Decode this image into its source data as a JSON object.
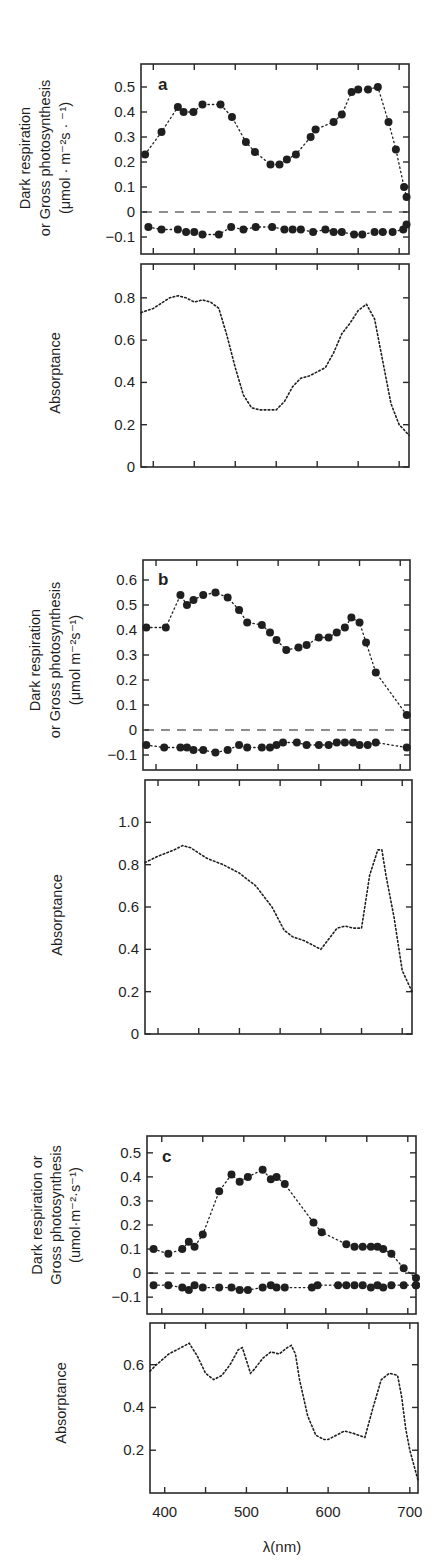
{
  "figure": {
    "xlabel": "λ(nm)",
    "x_tick_labels": [
      "400",
      "500",
      "600",
      "700"
    ]
  },
  "chart_data": [
    {
      "panel": "a",
      "type": "scatter",
      "title": "a",
      "ylabel_lines": [
        "Dark respiration",
        "or Gross photosynthesis",
        "(μmol · m⁻²s · ⁻¹)"
      ],
      "xlabel": "λ(nm)",
      "xlim": [
        385,
        712
      ],
      "ylim": [
        -0.168,
        0.592
      ],
      "yticks": [
        -0.1,
        0,
        0.1,
        0.2,
        0.3,
        0.4,
        0.5
      ],
      "ytick_labels": [
        "−0.1",
        "0",
        "0.1",
        "0.2",
        "0.3",
        "0.4",
        "0.5"
      ],
      "zero_line": "dashed",
      "series": [
        {
          "name": "Gross photosynthesis",
          "x": [
            390,
            410,
            430,
            437,
            449,
            460,
            482,
            496,
            513,
            524,
            543,
            554,
            563,
            574,
            592,
            598,
            620,
            630,
            642,
            650,
            662,
            674,
            687,
            696,
            706,
            709
          ],
          "y": [
            0.23,
            0.32,
            0.42,
            0.4,
            0.4,
            0.43,
            0.43,
            0.38,
            0.28,
            0.24,
            0.19,
            0.19,
            0.21,
            0.23,
            0.3,
            0.33,
            0.36,
            0.39,
            0.48,
            0.49,
            0.49,
            0.5,
            0.36,
            0.25,
            0.1,
            0.06
          ]
        },
        {
          "name": "Dark respiration",
          "x": [
            394,
            410,
            430,
            440,
            450,
            460,
            480,
            495,
            510,
            525,
            545,
            560,
            570,
            580,
            595,
            610,
            620,
            630,
            645,
            655,
            670,
            680,
            692,
            705,
            709
          ],
          "y": [
            -0.06,
            -0.07,
            -0.07,
            -0.08,
            -0.08,
            -0.09,
            -0.09,
            -0.06,
            -0.07,
            -0.06,
            -0.06,
            -0.07,
            -0.07,
            -0.07,
            -0.08,
            -0.07,
            -0.08,
            -0.08,
            -0.09,
            -0.09,
            -0.08,
            -0.08,
            -0.08,
            -0.07,
            -0.05
          ]
        }
      ]
    },
    {
      "panel": "a",
      "type": "line",
      "ylabel": "Absorptance",
      "xlim": [
        385,
        712
      ],
      "ylim": [
        0,
        0.96
      ],
      "yticks": [
        0,
        0.2,
        0.4,
        0.6,
        0.8
      ],
      "ytick_labels": [
        "0",
        "0.2",
        "0.4",
        "0.6",
        "0.8"
      ],
      "series": [
        {
          "name": "Absorptance",
          "x": [
            385,
            400,
            420,
            430,
            440,
            450,
            460,
            470,
            480,
            490,
            500,
            510,
            520,
            530,
            540,
            550,
            560,
            570,
            580,
            590,
            600,
            610,
            620,
            630,
            640,
            650,
            660,
            670,
            680,
            690,
            700,
            705,
            712
          ],
          "y": [
            0.73,
            0.75,
            0.8,
            0.81,
            0.8,
            0.78,
            0.79,
            0.78,
            0.75,
            0.62,
            0.47,
            0.34,
            0.28,
            0.27,
            0.27,
            0.27,
            0.31,
            0.38,
            0.42,
            0.43,
            0.45,
            0.47,
            0.54,
            0.63,
            0.68,
            0.74,
            0.77,
            0.7,
            0.5,
            0.3,
            0.2,
            0.18,
            0.15
          ]
        }
      ]
    },
    {
      "panel": "b",
      "type": "scatter",
      "title": "b",
      "ylabel_lines": [
        "Dark respiration",
        "or Gross photosynthesis",
        "(μmol m⁻²s⁻¹)"
      ],
      "xlabel": "λ(nm)",
      "xlim": [
        384,
        712
      ],
      "ylim": [
        -0.16,
        0.68
      ],
      "yticks": [
        -0.1,
        0,
        0.1,
        0.2,
        0.3,
        0.4,
        0.5,
        0.6
      ],
      "ytick_labels": [
        "−0.1",
        "0",
        "0.1",
        "0.2",
        "0.3",
        "0.4",
        "0.5",
        "0.6"
      ],
      "zero_line": "dashed",
      "series": [
        {
          "name": "Gross photosynthesis",
          "x": [
            388,
            412,
            430,
            438,
            446,
            458,
            473,
            488,
            502,
            512,
            530,
            540,
            548,
            560,
            575,
            585,
            600,
            612,
            622,
            632,
            640,
            650,
            658,
            670,
            708
          ],
          "y": [
            0.41,
            0.41,
            0.54,
            0.5,
            0.52,
            0.54,
            0.55,
            0.53,
            0.48,
            0.43,
            0.42,
            0.39,
            0.36,
            0.32,
            0.33,
            0.34,
            0.37,
            0.37,
            0.39,
            0.41,
            0.45,
            0.43,
            0.35,
            0.23,
            0.06
          ]
        },
        {
          "name": "Dark respiration",
          "x": [
            388,
            410,
            430,
            438,
            446,
            458,
            473,
            488,
            502,
            512,
            530,
            540,
            548,
            556,
            573,
            585,
            600,
            612,
            622,
            632,
            642,
            650,
            660,
            670,
            708
          ],
          "y": [
            -0.06,
            -0.07,
            -0.07,
            -0.07,
            -0.08,
            -0.08,
            -0.09,
            -0.08,
            -0.06,
            -0.07,
            -0.07,
            -0.07,
            -0.06,
            -0.05,
            -0.05,
            -0.06,
            -0.06,
            -0.06,
            -0.05,
            -0.05,
            -0.05,
            -0.06,
            -0.06,
            -0.05,
            -0.07
          ]
        }
      ]
    },
    {
      "panel": "b",
      "type": "line",
      "ylabel": "Absorptance",
      "xlim": [
        384,
        712
      ],
      "ylim": [
        0,
        1.2
      ],
      "yticks": [
        0,
        0.2,
        0.4,
        0.6,
        0.8,
        1.0
      ],
      "ytick_labels": [
        "0",
        "0.2",
        "0.4",
        "0.6",
        "0.8",
        "1.0"
      ],
      "series": [
        {
          "name": "Absorptance",
          "x": [
            384,
            400,
            420,
            430,
            440,
            460,
            480,
            500,
            520,
            540,
            555,
            565,
            580,
            590,
            600,
            610,
            620,
            630,
            640,
            650,
            660,
            670,
            675,
            680,
            690,
            700,
            712
          ],
          "y": [
            0.81,
            0.84,
            0.87,
            0.89,
            0.88,
            0.83,
            0.8,
            0.76,
            0.7,
            0.6,
            0.49,
            0.46,
            0.44,
            0.42,
            0.4,
            0.45,
            0.5,
            0.51,
            0.5,
            0.5,
            0.75,
            0.87,
            0.87,
            0.75,
            0.55,
            0.3,
            0.2
          ]
        }
      ]
    },
    {
      "panel": "c",
      "type": "scatter",
      "title": "c",
      "ylabel_lines": [
        "Dark respiration or",
        "Gross photosynthesis",
        "(umol·m⁻²·s⁻¹)"
      ],
      "xlabel": "λ(nm)",
      "xlim": [
        382,
        710
      ],
      "ylim": [
        -0.17,
        0.57
      ],
      "yticks": [
        -0.1,
        0,
        0.1,
        0.2,
        0.3,
        0.4,
        0.5
      ],
      "ytick_labels": [
        "−0.1",
        "0",
        "0.1",
        "0.2",
        "0.3",
        "0.4",
        "0.5"
      ],
      "zero_line": "dashed",
      "series": [
        {
          "name": "Gross photosynthesis",
          "x": [
            390,
            408,
            425,
            433,
            440,
            450,
            470,
            485,
            495,
            505,
            523,
            533,
            540,
            550,
            585,
            595,
            625,
            635,
            645,
            655,
            663,
            670,
            680,
            695,
            710,
            710
          ],
          "y": [
            0.1,
            0.08,
            0.1,
            0.13,
            0.11,
            0.16,
            0.34,
            0.41,
            0.38,
            0.4,
            0.43,
            0.39,
            0.4,
            0.37,
            0.21,
            0.17,
            0.12,
            0.11,
            0.11,
            0.11,
            0.11,
            0.1,
            0.08,
            0.02,
            -0.02,
            -0.05
          ]
        },
        {
          "name": "Dark respiration",
          "x": [
            390,
            408,
            425,
            433,
            440,
            450,
            470,
            485,
            495,
            505,
            523,
            533,
            540,
            550,
            583,
            590,
            615,
            625,
            635,
            645,
            655,
            663,
            670,
            680,
            695,
            710
          ],
          "y": [
            -0.05,
            -0.05,
            -0.06,
            -0.07,
            -0.05,
            -0.06,
            -0.06,
            -0.06,
            -0.07,
            -0.07,
            -0.06,
            -0.05,
            -0.06,
            -0.06,
            -0.06,
            -0.05,
            -0.05,
            -0.05,
            -0.05,
            -0.05,
            -0.06,
            -0.05,
            -0.06,
            -0.05,
            -0.05,
            -0.05
          ]
        }
      ]
    },
    {
      "panel": "c",
      "type": "line",
      "ylabel": "Absorptance",
      "xlabel": "λ(nm)",
      "xlim": [
        382,
        710
      ],
      "ylim": [
        0,
        0.795
      ],
      "yticks": [
        0.2,
        0.4,
        0.6
      ],
      "ytick_labels": [
        "0.2",
        "0.4",
        "0.6"
      ],
      "xticks": [
        400,
        450,
        500,
        550,
        600,
        650,
        700
      ],
      "xtick_labels": [
        "400",
        "",
        "500",
        "",
        "600",
        "",
        "700"
      ],
      "series": [
        {
          "name": "Absorptance",
          "x": [
            382,
            390,
            405,
            420,
            430,
            440,
            450,
            460,
            470,
            480,
            490,
            495,
            500,
            505,
            510,
            520,
            530,
            540,
            550,
            555,
            560,
            565,
            575,
            585,
            595,
            600,
            610,
            620,
            630,
            645,
            655,
            665,
            675,
            685,
            690,
            695,
            700,
            710
          ],
          "y": [
            0.57,
            0.6,
            0.65,
            0.68,
            0.7,
            0.64,
            0.56,
            0.53,
            0.55,
            0.6,
            0.67,
            0.68,
            0.62,
            0.56,
            0.58,
            0.63,
            0.66,
            0.65,
            0.68,
            0.69,
            0.65,
            0.53,
            0.36,
            0.27,
            0.25,
            0.25,
            0.27,
            0.29,
            0.28,
            0.26,
            0.4,
            0.53,
            0.56,
            0.55,
            0.45,
            0.3,
            0.2,
            0.06
          ]
        }
      ]
    }
  ],
  "panels_layout": [
    {
      "frame": {
        "left": 141,
        "top": 64,
        "right": 409,
        "bottom": 254
      },
      "chart": 0,
      "label_pos": [
        158,
        90
      ],
      "ylabel_x": [
        30,
        50,
        70
      ],
      "ytitle_cy": 158
    },
    {
      "frame": {
        "left": 141,
        "top": 264,
        "right": 409,
        "bottom": 467
      },
      "chart": 1,
      "ylabel_x": [
        60
      ],
      "ytitle_cy": 373
    },
    {
      "frame": {
        "left": 143,
        "top": 560,
        "right": 410,
        "bottom": 770
      },
      "chart": 2,
      "label_pos": [
        158,
        585
      ],
      "ylabel_x": [
        40,
        60,
        80
      ],
      "ytitle_cy": 660
    },
    {
      "frame": {
        "left": 145,
        "top": 780,
        "right": 412,
        "bottom": 1034
      },
      "chart": 3,
      "ylabel_x": [
        62
      ],
      "ytitle_cy": 915
    },
    {
      "frame": {
        "left": 147,
        "top": 1136,
        "right": 416,
        "bottom": 1314
      },
      "chart": 4,
      "label_pos": [
        162,
        1162
      ],
      "ylabel_x": [
        42,
        61,
        80
      ],
      "ytitle_cy": 1215
    },
    {
      "frame": {
        "left": 150,
        "top": 1323,
        "right": 418,
        "bottom": 1493
      },
      "chart": 5,
      "ylabel_x": [
        66
      ],
      "ytitle_cy": 1403
    }
  ],
  "colors": {
    "ink": "#1f1f1f",
    "frame": "#2a2a2a",
    "background": "#ffffff"
  }
}
